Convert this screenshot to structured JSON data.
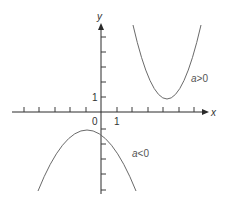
{
  "figure": {
    "type": "diagram",
    "axes": {
      "x_label": "x",
      "y_label": "y",
      "origin_label": "0",
      "x_unit_label": "1",
      "y_unit_label": "1"
    },
    "curves": [
      {
        "name": "upward-parabola",
        "label_prefix": "a",
        "label_op": ">",
        "label_value": "0",
        "label": "a>0",
        "color": "#6a6a6a"
      },
      {
        "name": "downward-parabola",
        "label_prefix": "a",
        "label_op": "<",
        "label_value": "0",
        "label": "a<0",
        "color": "#6a6a6a"
      }
    ]
  },
  "colors": {
    "axis": "#2a2a2a",
    "curve": "#6a6a6a",
    "text": "#333333",
    "background": "#ffffff"
  }
}
